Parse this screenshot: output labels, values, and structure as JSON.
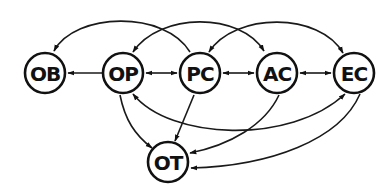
{
  "diagram": {
    "type": "directed-graph",
    "colors": {
      "stroke": "#111111",
      "background": "#ffffff"
    },
    "nodes": [
      {
        "id": "OB",
        "label": "OB",
        "x": 45,
        "y": 73
      },
      {
        "id": "OP",
        "label": "OP",
        "x": 123,
        "y": 73
      },
      {
        "id": "PC",
        "label": "PC",
        "x": 200,
        "y": 73
      },
      {
        "id": "AC",
        "label": "AC",
        "x": 277,
        "y": 73
      },
      {
        "id": "EC",
        "label": "EC",
        "x": 354,
        "y": 73
      },
      {
        "id": "OT",
        "label": "OT",
        "x": 168,
        "y": 162
      }
    ],
    "edges": [
      {
        "from": "OP",
        "to": "OB",
        "bidirectional": false,
        "shape": "straight"
      },
      {
        "from": "OP",
        "to": "PC",
        "bidirectional": true,
        "shape": "straight"
      },
      {
        "from": "PC",
        "to": "AC",
        "bidirectional": true,
        "shape": "straight"
      },
      {
        "from": "AC",
        "to": "EC",
        "bidirectional": true,
        "shape": "straight"
      },
      {
        "from": "PC",
        "to": "OB",
        "bidirectional": false,
        "shape": "upper-arc"
      },
      {
        "from": "OP",
        "to": "AC",
        "bidirectional": true,
        "shape": "upper-arc"
      },
      {
        "from": "PC",
        "to": "EC",
        "bidirectional": true,
        "shape": "upper-arc"
      },
      {
        "from": "OP",
        "to": "EC",
        "bidirectional": true,
        "shape": "lower-arc"
      },
      {
        "from": "OP",
        "to": "OT",
        "bidirectional": false,
        "shape": "curve"
      },
      {
        "from": "PC",
        "to": "OT",
        "bidirectional": false,
        "shape": "straight"
      },
      {
        "from": "AC",
        "to": "OT",
        "bidirectional": false,
        "shape": "curve"
      },
      {
        "from": "EC",
        "to": "OT",
        "bidirectional": false,
        "shape": "curve"
      }
    ]
  }
}
